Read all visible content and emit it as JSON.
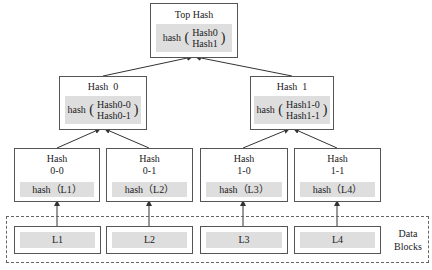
{
  "root": {
    "title": "Top Hash",
    "fn": "hash",
    "args": [
      "Hash0",
      "Hash1"
    ]
  },
  "level1": [
    {
      "title": "Hash  0",
      "fn": "hash",
      "args": [
        "Hash0-0",
        "Hash0-1"
      ]
    },
    {
      "title": "Hash  1",
      "fn": "hash",
      "args": [
        "Hash1-0",
        "Hash1-1"
      ]
    }
  ],
  "level2": [
    {
      "title_line1": "Hash",
      "title_line2": "0-0",
      "fn_text": "hash（L1）"
    },
    {
      "title_line1": "Hash",
      "title_line2": "0-1",
      "fn_text": "hash（L2）"
    },
    {
      "title_line1": "Hash",
      "title_line2": "1-0",
      "fn_text": "hash（L3）"
    },
    {
      "title_line1": "Hash",
      "title_line2": "1-1",
      "fn_text": "hash（L4）"
    }
  ],
  "data_blocks": {
    "label_line1": "Data",
    "label_line2": "Blocks",
    "items": [
      "L1",
      "L2",
      "L3",
      "L4"
    ]
  },
  "colors": {
    "border": "#555555",
    "band": "#dedede",
    "edge": "#333333"
  }
}
